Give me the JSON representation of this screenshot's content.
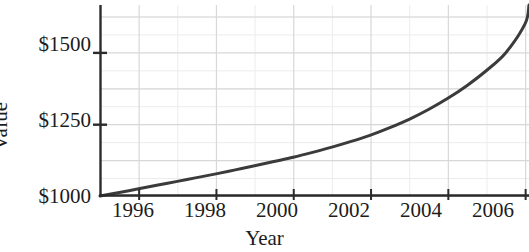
{
  "chart_data": {
    "type": "line",
    "title": "",
    "xlabel": "Year",
    "ylabel": "Value",
    "xlim": [
      1995,
      2006.1
    ],
    "ylim": [
      1000,
      1665
    ],
    "grid": true,
    "legend": null,
    "x_tick_labels": [
      "1996",
      "1998",
      "2000",
      "2002",
      "2004",
      "2006"
    ],
    "x_tick_values": [
      1996,
      1998,
      2000,
      2002,
      2004,
      2006
    ],
    "x_minor_tick_values": [
      1995,
      1997,
      1999,
      2001,
      2003,
      2005
    ],
    "y_tick_labels": [
      "$1000",
      "$1250",
      "$1500"
    ],
    "y_tick_values": [
      1000,
      1250,
      1500
    ],
    "y_minor_tick_values": [
      1062.5,
      1125,
      1187.5,
      1312.5,
      1375,
      1437.5,
      1562.5,
      1625
    ],
    "y_gridline_values": [
      1000,
      1125,
      1250,
      1375,
      1500,
      1625
    ],
    "series": [
      {
        "name": "Value",
        "x": [
          1995,
          1995.5,
          1996,
          1996.5,
          1997,
          1997.5,
          1998,
          1998.5,
          1999,
          1999.5,
          2000,
          2000.5,
          2001,
          2001.5,
          2002,
          2002.5,
          2003,
          2003.5,
          2004,
          2004.5,
          2005,
          2005.5,
          2006,
          2006.1
        ],
        "y": [
          1000,
          1012,
          1025,
          1038,
          1051,
          1064,
          1077,
          1091,
          1105,
          1120,
          1135,
          1152,
          1170,
          1190,
          1212,
          1238,
          1267,
          1301,
          1340,
          1385,
          1437,
          1499,
          1600,
          1665
        ],
        "color": "#3b3b3b",
        "line_width": 3
      }
    ],
    "colors": {
      "curve": "#3b3b3b",
      "axis": "#2b2b2b",
      "major_grid": "#d8d8d8",
      "minor_grid": "#ececec",
      "text": "#1c1c1c",
      "background": "#ffffff"
    }
  },
  "axis": {
    "y_title": "Value",
    "x_title": "Year",
    "y_ticks": [
      {
        "label": "$1500",
        "value": 1500
      },
      {
        "label": "$1250",
        "value": 1250
      },
      {
        "label": "$1000",
        "value": 1000
      }
    ],
    "x_ticks": [
      {
        "label": "1996",
        "value": 1996
      },
      {
        "label": "1998",
        "value": 1998
      },
      {
        "label": "2000",
        "value": 2000
      },
      {
        "label": "2002",
        "value": 2002
      },
      {
        "label": "2004",
        "value": 2004
      },
      {
        "label": "2006",
        "value": 2006
      }
    ]
  }
}
